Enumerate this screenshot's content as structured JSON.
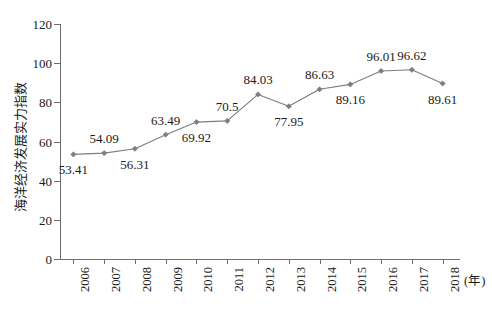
{
  "chart_data": {
    "type": "line",
    "title": "",
    "xlabel": "(年)",
    "ylabel": "海洋经济发展实力指数",
    "categories": [
      "2006",
      "2007",
      "2008",
      "2009",
      "2010",
      "2011",
      "2012",
      "2013",
      "2014",
      "2015",
      "2016",
      "2017",
      "2018"
    ],
    "values": [
      53.41,
      54.09,
      56.31,
      63.49,
      69.92,
      70.5,
      84.03,
      77.95,
      86.63,
      89.16,
      96.01,
      96.62,
      89.61
    ],
    "point_labels": [
      "53.41",
      "54.09",
      "56.31",
      "63.49",
      "69.92",
      "70.5",
      "84.03",
      "77.95",
      "86.63",
      "89.16",
      "96.01",
      "96.62",
      "89.61"
    ],
    "label_positions": [
      "below",
      "above",
      "below",
      "above",
      "below",
      "above",
      "above",
      "below",
      "above",
      "below",
      "above",
      "above",
      "below"
    ],
    "ylim": [
      0,
      120
    ],
    "y_ticks": [
      0,
      20,
      40,
      60,
      80,
      100,
      120
    ],
    "y_tick_labels": [
      "0",
      "20",
      "40",
      "60",
      "80",
      "100",
      "120"
    ],
    "grid": false,
    "legend": "none",
    "series_color": "#7d7d7d",
    "marker": "diamond",
    "axis_color": "#6e6e6e",
    "text_color": "#1a1a1a"
  }
}
